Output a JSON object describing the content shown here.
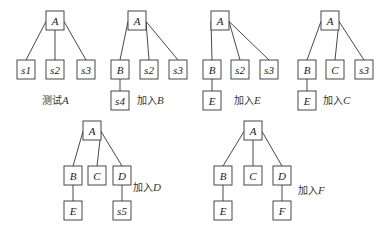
{
  "diagram": {
    "type": "tree-sequence",
    "trees": [
      {
        "caption": {
          "prefix": "测试",
          "var": "A"
        },
        "caption_pos": [
          42,
          104
        ],
        "nodes": [
          {
            "id": "A",
            "label": "A",
            "x": 46,
            "y": 11,
            "w": 18,
            "h": 19
          },
          {
            "id": "s1",
            "label": "s1",
            "x": 17,
            "y": 60,
            "w": 18,
            "h": 19
          },
          {
            "id": "s2",
            "label": "s2",
            "x": 46,
            "y": 60,
            "w": 18,
            "h": 19
          },
          {
            "id": "s3",
            "label": "s3",
            "x": 77,
            "y": 60,
            "w": 18,
            "h": 19
          }
        ],
        "edges": [
          [
            "A",
            "s1"
          ],
          [
            "A",
            "s2"
          ],
          [
            "A",
            "s3"
          ]
        ]
      },
      {
        "caption": {
          "prefix": "加入",
          "var": "B"
        },
        "caption_pos": [
          137,
          104
        ],
        "nodes": [
          {
            "id": "A",
            "label": "A",
            "x": 128,
            "y": 11,
            "w": 18,
            "h": 19
          },
          {
            "id": "B",
            "label": "B",
            "x": 111,
            "y": 60,
            "w": 18,
            "h": 19
          },
          {
            "id": "s2",
            "label": "s2",
            "x": 140,
            "y": 60,
            "w": 18,
            "h": 19
          },
          {
            "id": "s3",
            "label": "s3",
            "x": 169,
            "y": 60,
            "w": 18,
            "h": 19
          },
          {
            "id": "s4",
            "label": "s4",
            "x": 111,
            "y": 91,
            "w": 18,
            "h": 19
          }
        ],
        "edges": [
          [
            "A",
            "B"
          ],
          [
            "A",
            "s2"
          ],
          [
            "A",
            "s3"
          ],
          [
            "B",
            "s4"
          ]
        ]
      },
      {
        "caption": {
          "prefix": "加入",
          "var": "E"
        },
        "caption_pos": [
          234,
          104
        ],
        "nodes": [
          {
            "id": "A",
            "label": "A",
            "x": 211,
            "y": 11,
            "w": 18,
            "h": 19
          },
          {
            "id": "B",
            "label": "B",
            "x": 203,
            "y": 60,
            "w": 18,
            "h": 19
          },
          {
            "id": "s2",
            "label": "s2",
            "x": 231,
            "y": 60,
            "w": 18,
            "h": 19
          },
          {
            "id": "s3",
            "label": "s3",
            "x": 260,
            "y": 60,
            "w": 18,
            "h": 19
          },
          {
            "id": "E",
            "label": "E",
            "x": 203,
            "y": 91,
            "w": 18,
            "h": 19
          }
        ],
        "edges": [
          [
            "A",
            "B"
          ],
          [
            "A",
            "s2"
          ],
          [
            "A",
            "s3"
          ],
          [
            "B",
            "E"
          ]
        ]
      },
      {
        "caption": {
          "prefix": "加入",
          "var": "C"
        },
        "caption_pos": [
          323,
          104
        ],
        "nodes": [
          {
            "id": "A",
            "label": "A",
            "x": 321,
            "y": 11,
            "w": 18,
            "h": 19
          },
          {
            "id": "B",
            "label": "B",
            "x": 298,
            "y": 60,
            "w": 18,
            "h": 19
          },
          {
            "id": "C",
            "label": "C",
            "x": 326,
            "y": 60,
            "w": 18,
            "h": 19
          },
          {
            "id": "s3",
            "label": "s3",
            "x": 355,
            "y": 60,
            "w": 18,
            "h": 19
          },
          {
            "id": "E",
            "label": "E",
            "x": 298,
            "y": 91,
            "w": 18,
            "h": 19
          }
        ],
        "edges": [
          [
            "A",
            "B"
          ],
          [
            "A",
            "C"
          ],
          [
            "A",
            "s3"
          ],
          [
            "B",
            "E"
          ]
        ]
      },
      {
        "caption": {
          "prefix": "加入",
          "var": "D"
        },
        "caption_pos": [
          133,
          191
        ],
        "nodes": [
          {
            "id": "A",
            "label": "A",
            "x": 83,
            "y": 121,
            "w": 18,
            "h": 19
          },
          {
            "id": "B",
            "label": "B",
            "x": 64,
            "y": 166,
            "w": 18,
            "h": 19
          },
          {
            "id": "C",
            "label": "C",
            "x": 88,
            "y": 166,
            "w": 18,
            "h": 19
          },
          {
            "id": "D",
            "label": "D",
            "x": 113,
            "y": 166,
            "w": 18,
            "h": 19
          },
          {
            "id": "E",
            "label": "E",
            "x": 64,
            "y": 201,
            "w": 18,
            "h": 19
          },
          {
            "id": "s5",
            "label": "s5",
            "x": 113,
            "y": 201,
            "w": 18,
            "h": 19
          }
        ],
        "edges": [
          [
            "A",
            "B"
          ],
          [
            "A",
            "C"
          ],
          [
            "A",
            "D"
          ],
          [
            "B",
            "E"
          ],
          [
            "D",
            "s5"
          ]
        ]
      },
      {
        "caption": {
          "prefix": "加入",
          "var": "F"
        },
        "caption_pos": [
          298,
          194
        ],
        "nodes": [
          {
            "id": "A",
            "label": "A",
            "x": 244,
            "y": 121,
            "w": 18,
            "h": 19
          },
          {
            "id": "B",
            "label": "B",
            "x": 214,
            "y": 166,
            "w": 18,
            "h": 19
          },
          {
            "id": "C",
            "label": "C",
            "x": 244,
            "y": 166,
            "w": 18,
            "h": 19
          },
          {
            "id": "D",
            "label": "D",
            "x": 273,
            "y": 166,
            "w": 18,
            "h": 19
          },
          {
            "id": "E",
            "label": "E",
            "x": 214,
            "y": 201,
            "w": 18,
            "h": 19
          },
          {
            "id": "F",
            "label": "F",
            "x": 273,
            "y": 201,
            "w": 18,
            "h": 19
          }
        ],
        "edges": [
          [
            "A",
            "B"
          ],
          [
            "A",
            "C"
          ],
          [
            "A",
            "D"
          ],
          [
            "B",
            "E"
          ],
          [
            "D",
            "F"
          ]
        ]
      }
    ]
  }
}
